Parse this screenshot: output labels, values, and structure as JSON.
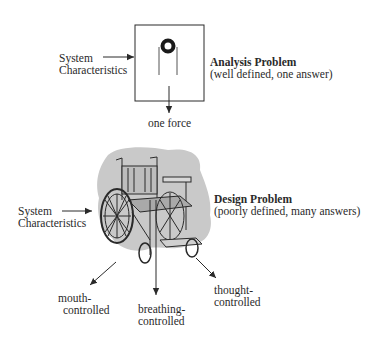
{
  "analysis": {
    "input_label_line1": "System",
    "input_label_line2": "Characteristics",
    "title": "Analysis Problem",
    "subtitle": "(well defined, one answer)",
    "output_label": "one force",
    "icon": "pulley-icon"
  },
  "design": {
    "input_label_line1": "System",
    "input_label_line2": "Characteristics",
    "title": "Design Problem",
    "subtitle": "(poorly defined, many answers)",
    "icon": "wheelchair-icon",
    "outputs": [
      {
        "line1": "mouth-",
        "line2": "controlled"
      },
      {
        "line1": "breathing-",
        "line2": "controlled"
      },
      {
        "line1": "thought-",
        "line2": "controlled"
      }
    ]
  },
  "colors": {
    "ink": "#2a2a2a",
    "blob": "#c9c9c9",
    "background": "#ffffff"
  }
}
